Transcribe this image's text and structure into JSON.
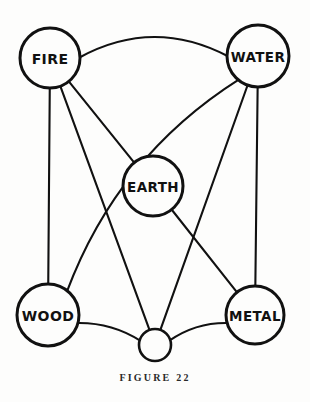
{
  "figure": {
    "caption": "FIGURE 22",
    "background_color": "#fdfdfc",
    "ink_color": "#111111"
  },
  "diagram": {
    "type": "node-link-graph",
    "nodes": [
      {
        "id": "fire",
        "label": "FIRE",
        "cx": 50,
        "cy": 58,
        "r": 30,
        "labelled": true
      },
      {
        "id": "water",
        "label": "WATER",
        "cx": 258,
        "cy": 56,
        "r": 31,
        "labelled": true
      },
      {
        "id": "earth",
        "label": "EARTH",
        "cx": 153,
        "cy": 186,
        "r": 30,
        "labelled": true
      },
      {
        "id": "wood",
        "label": "WOOD",
        "cx": 48,
        "cy": 315,
        "r": 31,
        "labelled": true
      },
      {
        "id": "metal",
        "label": "METAL",
        "cx": 255,
        "cy": 315,
        "r": 29,
        "labelled": true
      },
      {
        "id": "node6",
        "label": "",
        "cx": 155,
        "cy": 345,
        "r": 16,
        "labelled": false
      }
    ],
    "edges": [
      {
        "from": "fire",
        "to": "water",
        "shape": "arc",
        "curve": -40
      },
      {
        "from": "fire",
        "to": "wood",
        "shape": "line",
        "curve": 0
      },
      {
        "from": "fire",
        "to": "earth",
        "shape": "line",
        "curve": 0
      },
      {
        "from": "fire",
        "to": "node6",
        "shape": "line",
        "curve": 0
      },
      {
        "from": "water",
        "to": "wood",
        "shape": "arc",
        "curve": 46
      },
      {
        "from": "water",
        "to": "metal",
        "shape": "line",
        "curve": 0
      },
      {
        "from": "water",
        "to": "node6",
        "shape": "line",
        "curve": 0
      },
      {
        "from": "earth",
        "to": "metal",
        "shape": "line",
        "curve": 0
      },
      {
        "from": "wood",
        "to": "node6",
        "shape": "arc",
        "curve": -10
      },
      {
        "from": "metal",
        "to": "node6",
        "shape": "arc",
        "curve": 10
      }
    ]
  }
}
